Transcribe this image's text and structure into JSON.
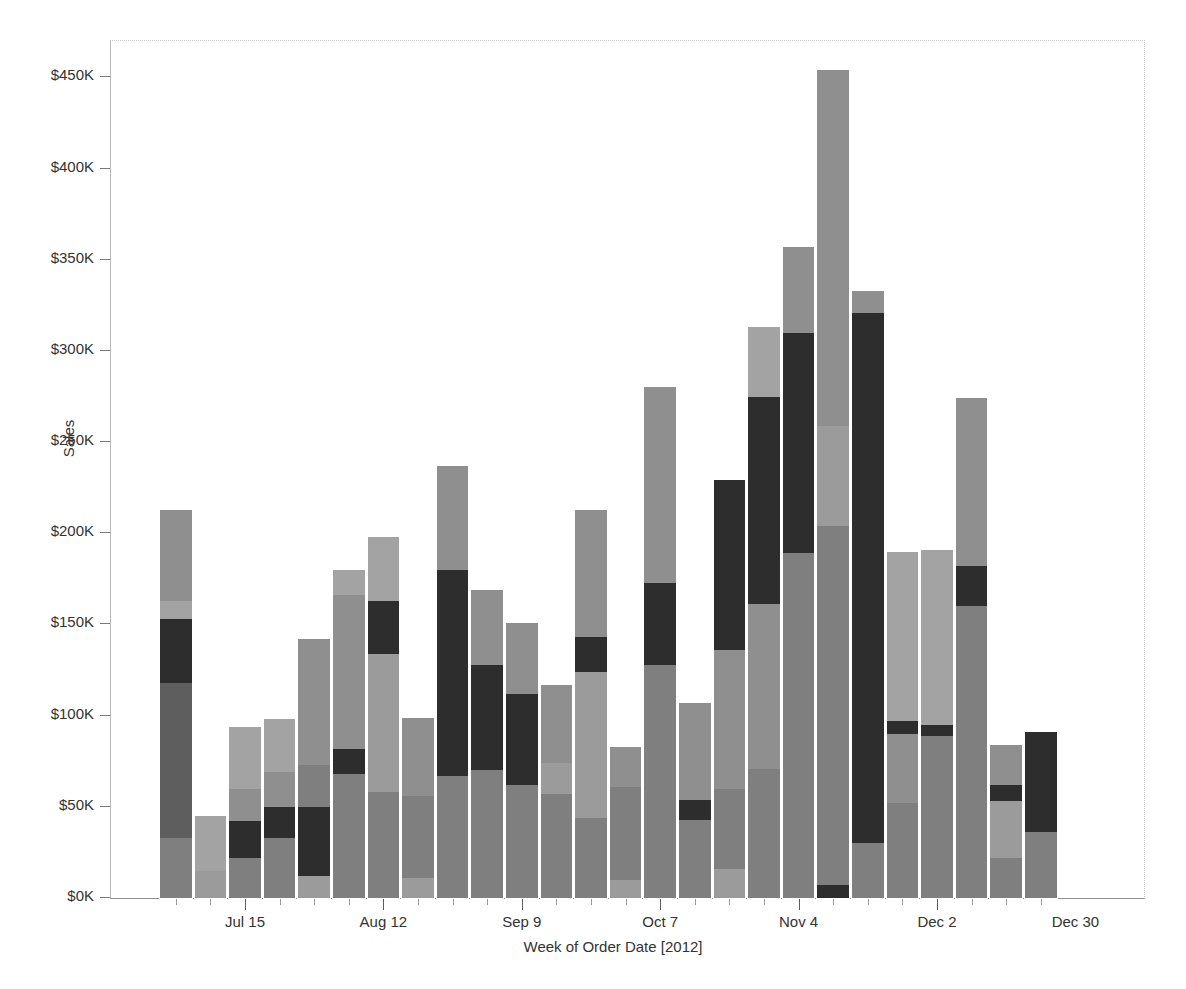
{
  "chart_data": {
    "type": "bar",
    "subtype": "stacked-bar",
    "title": "",
    "xlabel": "Week of Order Date [2012]",
    "ylabel": "Sales",
    "ylim": [
      0,
      470000
    ],
    "ytick_values": [
      0,
      50000,
      100000,
      150000,
      200000,
      250000,
      300000,
      350000,
      400000,
      450000
    ],
    "ytick_labels": [
      "$0K",
      "$50K",
      "$100K",
      "$150K",
      "$200K",
      "$250K",
      "$300K",
      "$350K",
      "$400K",
      "$450K"
    ],
    "xtick_labels": [
      "Jul 15",
      "Aug 12",
      "Sep 9",
      "Oct 7",
      "Nov 4",
      "Dec 2",
      "Dec 30"
    ],
    "xtick_indices": [
      2,
      6,
      10,
      14,
      18,
      22,
      26
    ],
    "grid": false,
    "legend": "none",
    "bar_gap_px": 3,
    "segment_colors": [
      "#7f7f7f",
      "#a3a3a3",
      "#5e5e5e",
      "#8f8f8f",
      "#2d2d2d",
      "#9b9b9b"
    ],
    "categories": [
      "Jul 1",
      "Jul 8",
      "Jul 15",
      "Jul 22",
      "Jul 29",
      "Aug 5",
      "Aug 12",
      "Aug 19",
      "Aug 26",
      "Sep 2",
      "Sep 9",
      "Sep 16",
      "Sep 23",
      "Sep 30",
      "Oct 7",
      "Oct 14",
      "Oct 21",
      "Oct 28",
      "Nov 4",
      "Nov 11",
      "Nov 18",
      "Nov 25",
      "Dec 2",
      "Dec 9",
      "Dec 16",
      "Dec 23",
      "Dec 30",
      "Jan 6"
    ],
    "totals": [
      213000,
      45000,
      94000,
      98000,
      142000,
      180000,
      198000,
      99000,
      237000,
      169000,
      151000,
      117000,
      213000,
      83000,
      280000,
      107000,
      229000,
      313000,
      357000,
      454000,
      333000,
      190000,
      191000,
      274000,
      84000,
      91000,
      0,
      0
    ],
    "bars": [
      {
        "label": "Jul 1",
        "total": 213000,
        "segments": [
          {
            "color": "#7f7f7f",
            "value": 33000
          },
          {
            "color": "#5e5e5e",
            "value": 85000
          },
          {
            "color": "#2d2d2d",
            "value": 35000
          },
          {
            "color": "#a3a3a3",
            "value": 10000
          },
          {
            "color": "#8f8f8f",
            "value": 50000
          }
        ]
      },
      {
        "label": "Jul 8",
        "total": 45000,
        "segments": [
          {
            "color": "#9b9b9b",
            "value": 15000
          },
          {
            "color": "#a3a3a3",
            "value": 30000
          }
        ]
      },
      {
        "label": "Jul 15",
        "total": 94000,
        "segments": [
          {
            "color": "#7f7f7f",
            "value": 22000
          },
          {
            "color": "#2d2d2d",
            "value": 20000
          },
          {
            "color": "#8f8f8f",
            "value": 18000
          },
          {
            "color": "#a3a3a3",
            "value": 34000
          }
        ]
      },
      {
        "label": "Jul 22",
        "total": 98000,
        "segments": [
          {
            "color": "#7f7f7f",
            "value": 33000
          },
          {
            "color": "#2d2d2d",
            "value": 17000
          },
          {
            "color": "#8f8f8f",
            "value": 19000
          },
          {
            "color": "#a3a3a3",
            "value": 29000
          }
        ]
      },
      {
        "label": "Jul 29",
        "total": 142000,
        "segments": [
          {
            "color": "#9b9b9b",
            "value": 12000
          },
          {
            "color": "#2d2d2d",
            "value": 38000
          },
          {
            "color": "#7f7f7f",
            "value": 23000
          },
          {
            "color": "#8f8f8f",
            "value": 69000
          }
        ]
      },
      {
        "label": "Aug 5",
        "total": 180000,
        "segments": [
          {
            "color": "#7f7f7f",
            "value": 68000
          },
          {
            "color": "#2d2d2d",
            "value": 14000
          },
          {
            "color": "#8f8f8f",
            "value": 84000
          },
          {
            "color": "#a3a3a3",
            "value": 14000
          }
        ]
      },
      {
        "label": "Aug 12",
        "total": 198000,
        "segments": [
          {
            "color": "#7f7f7f",
            "value": 58000
          },
          {
            "color": "#9b9b9b",
            "value": 76000
          },
          {
            "color": "#2d2d2d",
            "value": 29000
          },
          {
            "color": "#a3a3a3",
            "value": 35000
          }
        ]
      },
      {
        "label": "Aug 19",
        "total": 99000,
        "segments": [
          {
            "color": "#9b9b9b",
            "value": 11000
          },
          {
            "color": "#7f7f7f",
            "value": 45000
          },
          {
            "color": "#8f8f8f",
            "value": 43000
          }
        ]
      },
      {
        "label": "Aug 26",
        "total": 237000,
        "segments": [
          {
            "color": "#7f7f7f",
            "value": 67000
          },
          {
            "color": "#2d2d2d",
            "value": 113000
          },
          {
            "color": "#8f8f8f",
            "value": 57000
          }
        ]
      },
      {
        "label": "Sep 2",
        "total": 169000,
        "segments": [
          {
            "color": "#7f7f7f",
            "value": 70000
          },
          {
            "color": "#2d2d2d",
            "value": 58000
          },
          {
            "color": "#8f8f8f",
            "value": 41000
          }
        ]
      },
      {
        "label": "Sep 9",
        "total": 151000,
        "segments": [
          {
            "color": "#7f7f7f",
            "value": 62000
          },
          {
            "color": "#2d2d2d",
            "value": 50000
          },
          {
            "color": "#8f8f8f",
            "value": 39000
          }
        ]
      },
      {
        "label": "Sep 16",
        "total": 117000,
        "segments": [
          {
            "color": "#7f7f7f",
            "value": 57000
          },
          {
            "color": "#9b9b9b",
            "value": 17000
          },
          {
            "color": "#8f8f8f",
            "value": 43000
          }
        ]
      },
      {
        "label": "Sep 23",
        "total": 213000,
        "segments": [
          {
            "color": "#7f7f7f",
            "value": 44000
          },
          {
            "color": "#9b9b9b",
            "value": 80000
          },
          {
            "color": "#2d2d2d",
            "value": 19000
          },
          {
            "color": "#8f8f8f",
            "value": 70000
          }
        ]
      },
      {
        "label": "Sep 30",
        "total": 83000,
        "segments": [
          {
            "color": "#9b9b9b",
            "value": 10000
          },
          {
            "color": "#7f7f7f",
            "value": 51000
          },
          {
            "color": "#8f8f8f",
            "value": 22000
          }
        ]
      },
      {
        "label": "Oct 7",
        "total": 280000,
        "segments": [
          {
            "color": "#7f7f7f",
            "value": 128000
          },
          {
            "color": "#2d2d2d",
            "value": 45000
          },
          {
            "color": "#8f8f8f",
            "value": 107000
          }
        ]
      },
      {
        "label": "Oct 14",
        "total": 107000,
        "segments": [
          {
            "color": "#7f7f7f",
            "value": 43000
          },
          {
            "color": "#2d2d2d",
            "value": 11000
          },
          {
            "color": "#8f8f8f",
            "value": 53000
          }
        ]
      },
      {
        "label": "Oct 21",
        "total": 229000,
        "segments": [
          {
            "color": "#9b9b9b",
            "value": 16000
          },
          {
            "color": "#7f7f7f",
            "value": 44000
          },
          {
            "color": "#8f8f8f",
            "value": 76000
          },
          {
            "color": "#2d2d2d",
            "value": 93000
          }
        ]
      },
      {
        "label": "Oct 28",
        "total": 313000,
        "segments": [
          {
            "color": "#7f7f7f",
            "value": 71000
          },
          {
            "color": "#8f8f8f",
            "value": 90000
          },
          {
            "color": "#2d2d2d",
            "value": 114000
          },
          {
            "color": "#a3a3a3",
            "value": 38000
          }
        ]
      },
      {
        "label": "Nov 4",
        "total": 357000,
        "segments": [
          {
            "color": "#7f7f7f",
            "value": 189000
          },
          {
            "color": "#2d2d2d",
            "value": 121000
          },
          {
            "color": "#8f8f8f",
            "value": 47000
          }
        ]
      },
      {
        "label": "Nov 11",
        "total": 454000,
        "segments": [
          {
            "color": "#2d2d2d",
            "value": 7000
          },
          {
            "color": "#7f7f7f",
            "value": 197000
          },
          {
            "color": "#9b9b9b",
            "value": 55000
          },
          {
            "color": "#8f8f8f",
            "value": 195000
          }
        ]
      },
      {
        "label": "Nov 18",
        "total": 333000,
        "segments": [
          {
            "color": "#7f7f7f",
            "value": 30000
          },
          {
            "color": "#2d2d2d",
            "value": 291000
          },
          {
            "color": "#8f8f8f",
            "value": 12000
          }
        ]
      },
      {
        "label": "Nov 25",
        "total": 190000,
        "segments": [
          {
            "color": "#7f7f7f",
            "value": 52000
          },
          {
            "color": "#8f8f8f",
            "value": 38000
          },
          {
            "color": "#2d2d2d",
            "value": 7000
          },
          {
            "color": "#a3a3a3",
            "value": 93000
          }
        ]
      },
      {
        "label": "Dec 2",
        "total": 191000,
        "segments": [
          {
            "color": "#7f7f7f",
            "value": 89000
          },
          {
            "color": "#2d2d2d",
            "value": 6000
          },
          {
            "color": "#a3a3a3",
            "value": 96000
          }
        ]
      },
      {
        "label": "Dec 9",
        "total": 274000,
        "segments": [
          {
            "color": "#7f7f7f",
            "value": 160000
          },
          {
            "color": "#2d2d2d",
            "value": 22000
          },
          {
            "color": "#8f8f8f",
            "value": 92000
          }
        ]
      },
      {
        "label": "Dec 16",
        "total": 84000,
        "segments": [
          {
            "color": "#7f7f7f",
            "value": 22000
          },
          {
            "color": "#9b9b9b",
            "value": 31000
          },
          {
            "color": "#2d2d2d",
            "value": 9000
          },
          {
            "color": "#8f8f8f",
            "value": 22000
          }
        ]
      },
      {
        "label": "Dec 23",
        "total": 91000,
        "segments": [
          {
            "color": "#7f7f7f",
            "value": 36000
          },
          {
            "color": "#2d2d2d",
            "value": 55000
          }
        ]
      }
    ]
  }
}
